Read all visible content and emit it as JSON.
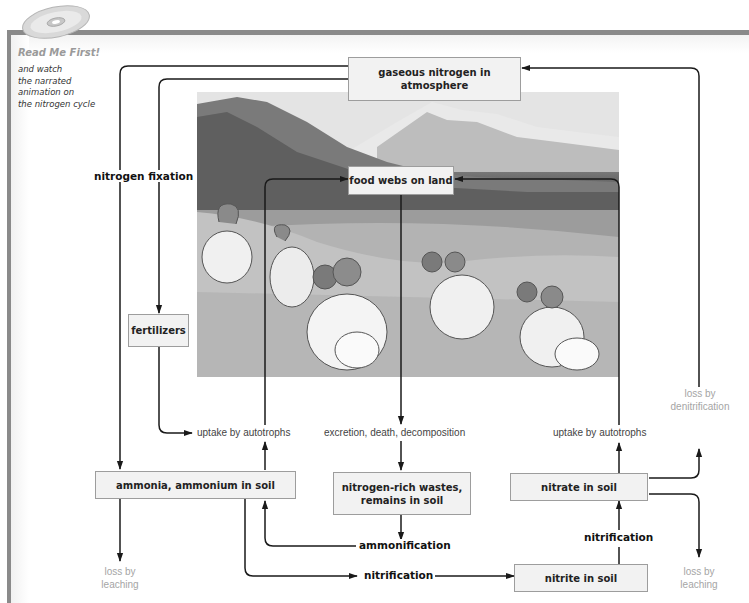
{
  "sidebar": {
    "cd_icon": "cd-disc-icon",
    "read_me_title": "Read Me First!",
    "read_me_lines": [
      "and watch",
      "the narrated",
      "animation on",
      "the nitrogen cycle"
    ]
  },
  "photo": {
    "subject": "bighorn rams resting on grassy hillside with snowy mountains",
    "color_mode": "grayscale"
  },
  "nodes": {
    "atmosphere": "gaseous nitrogen in atmosphere",
    "food_webs": "food webs on land",
    "fertilizers": "fertilizers",
    "ammonia": "ammonia, ammonium in soil",
    "wastes_line1": "nitrogen-rich wastes,",
    "wastes_line2": "remains in soil",
    "nitrate": "nitrate in soil",
    "nitrite": "nitrite in soil"
  },
  "process_labels": {
    "fixation": "nitrogen fixation",
    "ammonification": "ammonification",
    "nitrification_bottom": "nitrification",
    "nitrification_right": "nitrification"
  },
  "sub_labels": {
    "uptake_left": "uptake by autotrophs",
    "excretion": "excretion, death, decomposition",
    "uptake_right": "uptake by autotrophs"
  },
  "loss_labels": {
    "leaching_left_1": "loss by",
    "leaching_left_2": "leaching",
    "denitrification_1": "loss by",
    "denitrification_2": "denitrification",
    "leaching_right_1": "loss by",
    "leaching_right_2": "leaching"
  },
  "colors": {
    "frame_band": "#8a8a8a",
    "box_fill": "#f2f2f2",
    "box_border": "#9d9d9d",
    "arrow": "#1a1a1a",
    "loss_text": "#a5a5a5",
    "readme_text": "#9a9a9a"
  }
}
